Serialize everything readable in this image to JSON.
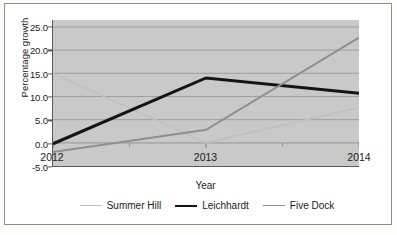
{
  "chart_data": {
    "type": "line",
    "title": "",
    "subtitle": "",
    "xlabel": "Year",
    "ylabel": "Percentage growth",
    "categories": [
      "2012",
      "2013",
      "2014"
    ],
    "x": [
      2012,
      2013,
      2014
    ],
    "ylim": [
      -5.0,
      26.5
    ],
    "yticks": [
      25.0,
      20.0,
      15.0,
      10.0,
      5.0,
      0.0,
      -5.0
    ],
    "ytick_labels": [
      "25.0",
      "20.0",
      "15.0",
      "10.0",
      "5.0",
      "0.0",
      "-5.0"
    ],
    "grid": true,
    "grid_axis": "y",
    "legend_position": "bottom",
    "plot_background": "#c9c9c9",
    "series": [
      {
        "name": "Summer Hill",
        "values": [
          15.0,
          0.0,
          7.6
        ],
        "color": "#c0c0c0",
        "width": 1.6
      },
      {
        "name": "Leichhardt",
        "values": [
          -0.2,
          14.0,
          10.7
        ],
        "color": "#141414",
        "width": 3.0
      },
      {
        "name": "Five Dock",
        "values": [
          -2.0,
          2.8,
          22.7
        ],
        "color": "#8f8f8f",
        "width": 2.0
      }
    ]
  },
  "axes": {
    "y_title": "Percentage growth",
    "x_title": "Year"
  },
  "colors": {
    "axis_line": "#5a5a5a",
    "grid_line": "#9d9d9d",
    "text": "#1b1b1b",
    "figure_border": "#8d8d8d",
    "plot_fill": "#c9c9c9"
  }
}
